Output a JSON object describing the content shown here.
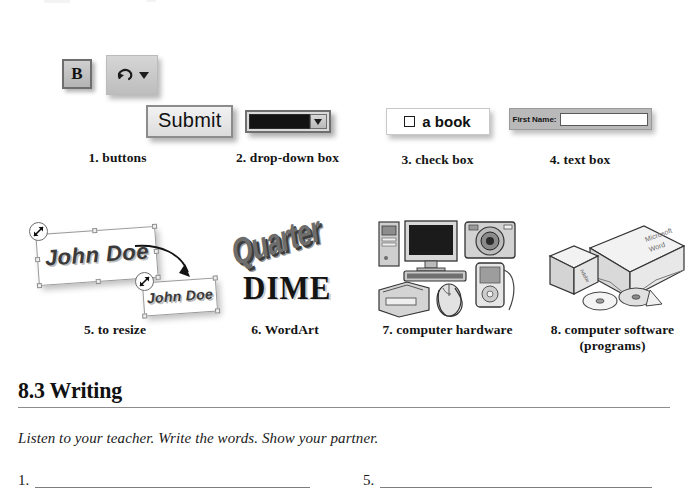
{
  "page": {
    "top_artifacts": [
      "",
      ""
    ]
  },
  "widgets": [
    {
      "number": "1.",
      "caption": "1. buttons",
      "bold_button_label": "B",
      "undo_icon": "undo-arrow-icon",
      "dropdown_caret_icon": "caret-down-icon",
      "submit_label": "Submit"
    },
    {
      "number": "2.",
      "caption": "2. drop-down box",
      "field_value": "",
      "arrow_icon": "caret-down-icon"
    },
    {
      "number": "3.",
      "caption": "3. check box",
      "checkbox_label": "a book",
      "checked": false
    },
    {
      "number": "4.",
      "caption": "4.  text box",
      "field_label": "First Name:",
      "field_value": ""
    },
    {
      "number": "5.",
      "caption": "5. to resize",
      "big_text": "John Doe",
      "small_text": "John Doe",
      "cursor_icon": "diagonal-resize-cursor-icon",
      "arrow_icon": "curved-arrow-icon"
    },
    {
      "number": "6.",
      "caption": "6. WordArt",
      "art_top_text": "Quarter",
      "art_bottom_text": "DIME"
    },
    {
      "number": "7.",
      "caption": "7. computer hardware",
      "devices": [
        "tower-pc",
        "monitor",
        "digital-camera",
        "keyboard",
        "printer",
        "mouse-with-hand",
        "mp3-player"
      ]
    },
    {
      "number": "8.",
      "caption": "8. computer software\n(programs)",
      "box_label": "Microsoft Word",
      "small_box_label": "Adobe",
      "items": [
        "software-box-large",
        "software-box-small",
        "cd-disc",
        "cd-disc"
      ]
    }
  ],
  "writing": {
    "heading": "8.3 Writing",
    "instructions": "Listen to your teacher. Write the words. Show your partner.",
    "answers": [
      {
        "number": "1.",
        "value": ""
      },
      {
        "number": "5.",
        "value": ""
      }
    ]
  },
  "colors": {
    "page_bg": "#ffffff",
    "text": "#1a1a1a",
    "rule": "#8d8d8d",
    "button_face": "#cfcfcf",
    "field_dark": "#131313"
  }
}
